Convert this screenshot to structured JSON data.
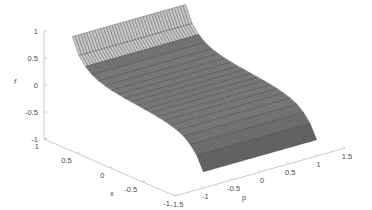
{
  "chart_data": {
    "type": "surface",
    "title": "",
    "xlabel": "x",
    "ylabel": "p",
    "zlabel": "f",
    "x_ticks": [
      "-1",
      "-0.5",
      "0",
      "0.5",
      "1"
    ],
    "p_ticks": [
      "-1.5",
      "-1",
      "-0.5",
      "0",
      "0.5",
      "1",
      "1.5"
    ],
    "z_ticks": [
      "-1",
      "-0.5",
      "0",
      "0.5",
      "1"
    ],
    "xlim": [
      -1,
      1
    ],
    "plim": [
      -1.5,
      1.5
    ],
    "zlim": [
      -1,
      1
    ],
    "grid": false,
    "surface_description": "f varies only with x along an S-shaped (cubic/tanh-like) profile, constant in p; rises to about 0.75 at x=1 and falls to about -0.7 at x=-1",
    "x_samples": [
      -1,
      -0.9,
      -0.8,
      -0.7,
      -0.6,
      -0.5,
      -0.4,
      -0.3,
      -0.2,
      -0.1,
      0,
      0.1,
      0.2,
      0.3,
      0.4,
      0.5,
      0.6,
      0.7,
      0.8,
      0.9,
      1
    ],
    "f_profile": [
      -0.7,
      -0.45,
      -0.3,
      -0.2,
      -0.14,
      -0.1,
      -0.07,
      -0.05,
      -0.03,
      -0.015,
      0,
      0.015,
      0.03,
      0.05,
      0.07,
      0.1,
      0.14,
      0.2,
      0.3,
      0.45,
      0.75
    ],
    "p_range_surface": [
      -1,
      1
    ],
    "mesh_color": "#3a3a3a",
    "face_color": "#8c8c8c",
    "axis_color": "#bfbfbf"
  },
  "axes": {
    "z_label": "f",
    "x_label": "x",
    "p_label": "p"
  }
}
